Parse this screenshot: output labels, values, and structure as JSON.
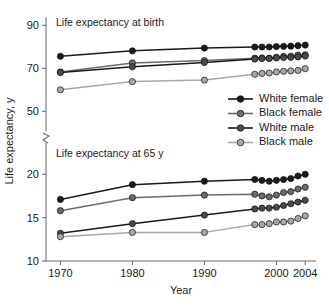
{
  "chart_data": {
    "type": "line",
    "title": "",
    "xlabel": "Year",
    "ylabel": "Life expectancy, y",
    "grid": false,
    "legend_position": "middle-right",
    "broken_axis": true,
    "panels": [
      {
        "id": "birth",
        "title": "Life expectancy at birth",
        "ylim": [
          45,
          92
        ],
        "yticks": [
          50,
          70,
          90
        ],
        "ytick_labels": [
          "50",
          "70",
          "90"
        ],
        "series": [
          {
            "name": "White female",
            "color": "#1a1a1a",
            "marker_fill": "#1a1a1a",
            "x": [
              1970,
              1980,
              1990,
              1997,
              1998,
              1999,
              2000,
              2001,
              2002,
              2003,
              2004
            ],
            "values": [
              75.6,
              78.1,
              79.4,
              79.9,
              79.9,
              79.9,
              80.1,
              80.2,
              80.3,
              80.5,
              80.8
            ]
          },
          {
            "name": "Black female",
            "color": "#6b6b6b",
            "marker_fill": "#6b6b6b",
            "x": [
              1970,
              1980,
              1990,
              1997,
              1998,
              1999,
              2000,
              2001,
              2002,
              2003,
              2004
            ],
            "values": [
              68.3,
              72.5,
              73.6,
              74.7,
              74.8,
              74.7,
              75.1,
              75.5,
              75.6,
              76.1,
              76.3
            ]
          },
          {
            "name": "White male",
            "color": "#1a1a1a",
            "marker_fill": "#4a4a4a",
            "x": [
              1970,
              1980,
              1990,
              1997,
              1998,
              1999,
              2000,
              2001,
              2002,
              2003,
              2004
            ],
            "values": [
              68.0,
              70.7,
              72.7,
              74.3,
              74.5,
              74.6,
              74.8,
              75.0,
              75.1,
              75.3,
              75.7
            ]
          },
          {
            "name": "Black male",
            "color": "#a8a8a8",
            "marker_fill": "#a8a8a8",
            "x": [
              1970,
              1980,
              1990,
              1997,
              1998,
              1999,
              2000,
              2001,
              2002,
              2003,
              2004
            ],
            "values": [
              60.0,
              63.8,
              64.5,
              67.2,
              67.6,
              67.8,
              68.3,
              68.6,
              68.8,
              69.0,
              69.8
            ]
          }
        ]
      },
      {
        "id": "at65",
        "title": "Life expectancy at 65 y",
        "ylim": [
          10,
          21.3
        ],
        "yticks": [
          10,
          15,
          20
        ],
        "ytick_labels": [
          "10",
          "15",
          "20"
        ],
        "series": [
          {
            "name": "White female",
            "color": "#1a1a1a",
            "marker_fill": "#1a1a1a",
            "x": [
              1970,
              1980,
              1990,
              1997,
              1998,
              1999,
              2000,
              2001,
              2002,
              2003,
              2004
            ],
            "values": [
              17.1,
              18.8,
              19.2,
              19.4,
              19.3,
              19.2,
              19.3,
              19.4,
              19.5,
              19.8,
              20.0
            ]
          },
          {
            "name": "Black female",
            "color": "#6b6b6b",
            "marker_fill": "#6b6b6b",
            "x": [
              1970,
              1980,
              1990,
              1997,
              1998,
              1999,
              2000,
              2001,
              2002,
              2003,
              2004
            ],
            "values": [
              15.8,
              17.3,
              17.6,
              17.7,
              17.5,
              17.4,
              17.6,
              17.9,
              18.0,
              18.3,
              18.5
            ]
          },
          {
            "name": "White male",
            "color": "#1a1a1a",
            "marker_fill": "#4a4a4a",
            "x": [
              1970,
              1980,
              1990,
              1997,
              1998,
              1999,
              2000,
              2001,
              2002,
              2003,
              2004
            ],
            "values": [
              13.2,
              14.3,
              15.3,
              16.0,
              16.1,
              16.1,
              16.2,
              16.4,
              16.6,
              16.8,
              17.0
            ]
          },
          {
            "name": "Black male",
            "color": "#a8a8a8",
            "marker_fill": "#a8a8a8",
            "x": [
              1970,
              1980,
              1990,
              1997,
              1998,
              1999,
              2000,
              2001,
              2002,
              2003,
              2004
            ],
            "values": [
              12.8,
              13.3,
              13.3,
              14.2,
              14.2,
              14.3,
              14.5,
              14.5,
              14.6,
              14.9,
              15.2
            ]
          }
        ]
      }
    ],
    "xticks": [
      1970,
      1980,
      1990,
      2000,
      2004
    ],
    "xtick_labels": [
      "1970",
      "1980",
      "1990",
      "2000",
      "2004"
    ],
    "xlim": [
      1968,
      2005.5
    ],
    "legend": [
      {
        "label": "White female",
        "line_color": "#1a1a1a",
        "dot_color": "#1a1a1a"
      },
      {
        "label": "Black female",
        "line_color": "#6b6b6b",
        "dot_color": "#6b6b6b"
      },
      {
        "label": "White male",
        "line_color": "#1a1a1a",
        "dot_color": "#4a4a4a"
      },
      {
        "label": "Black male",
        "line_color": "#a8a8a8",
        "dot_color": "#a8a8a8"
      }
    ]
  }
}
